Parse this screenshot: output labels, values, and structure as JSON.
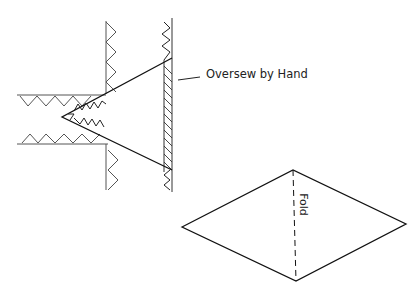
{
  "diagram": {
    "type": "sewing-instruction-illustration",
    "labels": {
      "oversew": "Oversew by Hand",
      "fold": "Fold"
    },
    "parts": [
      "seam-joint-with-inserted-triangle",
      "folded-diamond-patch"
    ],
    "colors": {
      "line": "#1a1a1a",
      "light_line": "#555555",
      "background": "#ffffff"
    }
  }
}
